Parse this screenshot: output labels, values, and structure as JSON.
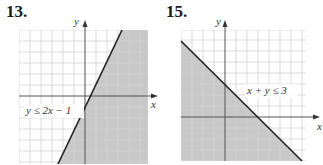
{
  "problems": [
    {
      "number": "13.",
      "inequality": "y ≤ 2x − 1",
      "x_axis_label": "x",
      "y_axis_label": "y",
      "boundary": "y = 2x - 1",
      "shaded_side": "below-right",
      "line_style": "solid"
    },
    {
      "number": "15.",
      "inequality": "x + y ≤ 3",
      "x_axis_label": "x",
      "y_axis_label": "y",
      "boundary": "x + y = 3",
      "shaded_side": "below-left",
      "line_style": "solid"
    }
  ],
  "colors": {
    "shade": "#c8c8c8",
    "grid": "#d4d4d4",
    "axis": "#555555",
    "line": "#222222"
  }
}
